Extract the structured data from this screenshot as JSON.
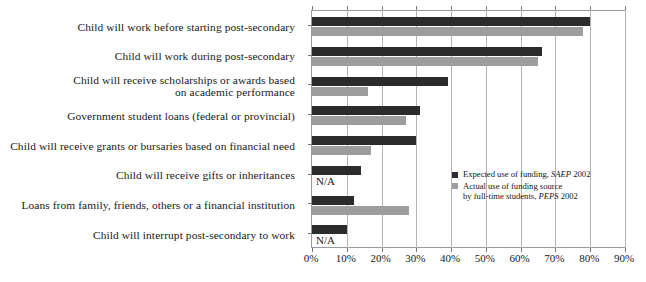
{
  "chart_data": {
    "type": "bar",
    "orientation": "horizontal",
    "title": "",
    "subtitle": "",
    "xlabel": "",
    "ylabel": "",
    "xlim": [
      0,
      90
    ],
    "xtick_labels": [
      "0%",
      "10%",
      "20%",
      "30%",
      "40%",
      "50%",
      "60%",
      "70%",
      "80%",
      "90%"
    ],
    "xtick_values": [
      0,
      10,
      20,
      30,
      40,
      50,
      60,
      70,
      80,
      90
    ],
    "grid": true,
    "legend_position": "inside-right",
    "categories": [
      "Child will work before starting post-secondary",
      "Child will work during post-secondary",
      "Child will receive scholarships or awards based on academic performance",
      "Government student loans (federal or provincial)",
      "Child will receive grants or bursaries based on financial need",
      "Child will receive gifts or inheritances",
      "Loans from family, friends, others or a financial institution",
      "Child will interrupt post-secondary to work"
    ],
    "category_lines": [
      [
        "Child will work before starting post-secondary"
      ],
      [
        "Child will work during post-secondary"
      ],
      [
        "Child will receive scholarships or awards based",
        "on academic performance"
      ],
      [
        "Government student loans (federal or provincial)"
      ],
      [
        "Child will receive grants or bursaries based on financial need"
      ],
      [
        "Child will receive gifts or inheritances"
      ],
      [
        "Loans from family, friends, others or a financial institution"
      ],
      [
        "Child will interrupt post-secondary to work"
      ]
    ],
    "series": [
      {
        "name": "Expected use of funding, SAEP 2002",
        "color": "#2b2b2b",
        "values": [
          80,
          66,
          39,
          31,
          30,
          14,
          12,
          10
        ]
      },
      {
        "name": "Actual use of funding source by full-time students, PEPS 2002",
        "color": "#9d9d9d",
        "values": [
          78,
          65,
          16,
          27,
          17,
          null,
          28,
          null
        ]
      }
    ],
    "annotations": [
      {
        "text": "N/A",
        "category_index": 5,
        "series_index": 1
      },
      {
        "text": "N/A",
        "category_index": 7,
        "series_index": 1
      }
    ]
  },
  "legend": {
    "items": [
      {
        "swatch": "dark",
        "line1_prefix": "Expected use of funding, ",
        "line1_source": "SAEP",
        "line1_suffix": " 2002",
        "line2_prefix": "",
        "line2_source": "",
        "line2_suffix": ""
      },
      {
        "swatch": "gray",
        "line1_prefix": "Actual use of funding source",
        "line1_source": "",
        "line1_suffix": "",
        "line2_prefix": "by full-time students, ",
        "line2_source": "PEPS",
        "line2_suffix": " 2002"
      }
    ]
  },
  "na_label": "N/A"
}
